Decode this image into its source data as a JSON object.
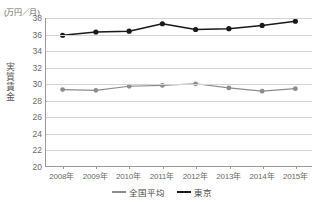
{
  "chart_data": {
    "type": "line",
    "title": "",
    "unit_label": "(万円／月)",
    "ylabel": "実質賃金",
    "xlabel": "",
    "categories": [
      "2008年",
      "2009年",
      "2010年",
      "2011年",
      "2012年",
      "2013年",
      "2014年",
      "2015年"
    ],
    "ylim": [
      20,
      38
    ],
    "yticks": [
      20,
      22,
      24,
      26,
      28,
      30,
      32,
      34,
      36,
      38
    ],
    "grid": true,
    "legend_position": "bottom",
    "series": [
      {
        "name": "全国平均",
        "color": "#8c8c8c",
        "marker": "circle",
        "values": [
          29.3,
          29.2,
          29.7,
          29.8,
          30.0,
          29.5,
          29.1,
          29.4
        ]
      },
      {
        "name": "東京",
        "color": "#1a1a1a",
        "marker": "circle",
        "values": [
          35.9,
          36.3,
          36.4,
          37.3,
          36.6,
          36.7,
          37.1,
          37.6
        ]
      }
    ]
  },
  "legend": {
    "items": [
      {
        "label": "全国平均",
        "color": "#8c8c8c"
      },
      {
        "label": "東京",
        "color": "#1a1a1a"
      }
    ]
  },
  "colors": {
    "axis": "#9a9a9a",
    "grid": "#d4d4d4",
    "text": "#6b6b6b",
    "background": "#ffffff"
  }
}
